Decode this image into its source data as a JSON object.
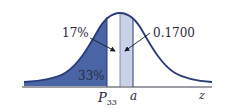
{
  "figure": {
    "type": "normal-distribution",
    "labels": {
      "left_callout": "17%",
      "right_callout": "0.1700",
      "tail_area": "33%",
      "percentile_label": "P",
      "percentile_sub": "33",
      "point_label": "a",
      "axis_label": "z"
    },
    "colors": {
      "curve": "#2b3a78",
      "dark_fill": "#4a65a6",
      "light_fill": "#c9d2e6",
      "axis": "#3a3a4a",
      "text": "#2a2a3a"
    }
  }
}
